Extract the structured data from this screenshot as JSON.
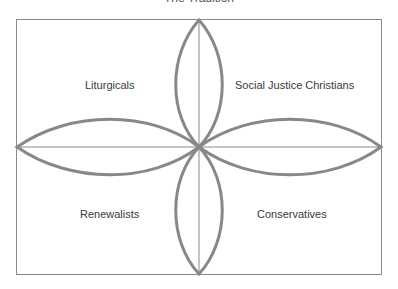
{
  "title": "The Tradition",
  "quadrants": {
    "top_left": "Liturgicals",
    "top_right": "Social Justice Christians",
    "bottom_left": "Renewalists",
    "bottom_right": "Conservatives"
  },
  "colors": {
    "petal_stroke": "#888888",
    "axis_stroke": "#8a8a8a",
    "frame_stroke": "#8a8a8a",
    "label_text": "#3a3a3a"
  }
}
